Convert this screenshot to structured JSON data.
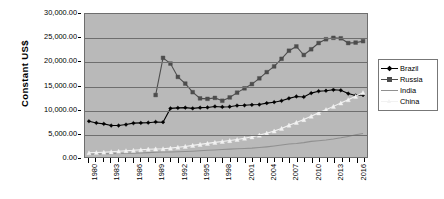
{
  "chart_data": {
    "type": "line",
    "title": "",
    "xlabel": "",
    "ylabel": "Constant US$",
    "ylim": [
      0,
      30000
    ],
    "ytick_labels": [
      "0.00",
      "5,000.00",
      "10,000.00",
      "15,000.00",
      "20,000.00",
      "25,000.00",
      "30,000.00"
    ],
    "ytick_values": [
      0,
      5000,
      10000,
      15000,
      20000,
      25000,
      30000
    ],
    "grid": true,
    "legend_position": "right",
    "x": [
      1980,
      1981,
      1982,
      1983,
      1984,
      1985,
      1986,
      1987,
      1988,
      1989,
      1990,
      1991,
      1992,
      1993,
      1994,
      1995,
      1996,
      1997,
      1998,
      1999,
      2000,
      2001,
      2002,
      2003,
      2004,
      2005,
      2006,
      2007,
      2008,
      2009,
      2010,
      2011,
      2012,
      2013,
      2014,
      2015,
      2016,
      2017
    ],
    "xtick_labels": [
      "1980",
      "1983",
      "1986",
      "1989",
      "1992",
      "1995",
      "1998",
      "2001",
      "2004",
      "2007",
      "2010",
      "2013",
      "2016"
    ],
    "xtick_values": [
      1980,
      1983,
      1986,
      1989,
      1992,
      1995,
      1998,
      2001,
      2004,
      2007,
      2010,
      2013,
      2016
    ],
    "xlim": [
      1980,
      2017
    ],
    "series": [
      {
        "name": "Brazil",
        "color": "#000000",
        "marker": "diamond",
        "x": [
          1980,
          1981,
          1982,
          1983,
          1984,
          1985,
          1986,
          1987,
          1988,
          1989,
          1990,
          1991,
          1992,
          1993,
          1994,
          1995,
          1996,
          1997,
          1998,
          1999,
          2000,
          2001,
          2002,
          2003,
          2004,
          2005,
          2006,
          2007,
          2008,
          2009,
          2010,
          2011,
          2012,
          2013,
          2014,
          2015,
          2016,
          2017
        ],
        "values": [
          7500,
          7150,
          6950,
          6600,
          6600,
          6800,
          7100,
          7150,
          7200,
          7350,
          7300,
          10200,
          10300,
          10350,
          10200,
          10350,
          10400,
          10600,
          10500,
          10550,
          10800,
          10850,
          10950,
          11000,
          11300,
          11500,
          11800,
          12300,
          12700,
          12600,
          13400,
          13800,
          13900,
          14100,
          14000,
          13300,
          12900,
          13000
        ]
      },
      {
        "name": "Russia",
        "color": "#4d4d4d",
        "marker": "square",
        "x": [
          1989,
          1990,
          1991,
          1992,
          1993,
          1994,
          1995,
          1996,
          1997,
          1998,
          1999,
          2000,
          2001,
          2002,
          2003,
          2004,
          2005,
          2006,
          2007,
          2008,
          2009,
          2010,
          2011,
          2012,
          2013,
          2014,
          2015,
          2016,
          2017
        ],
        "values": [
          13000,
          20800,
          19600,
          16800,
          15400,
          13600,
          12300,
          12200,
          12400,
          11800,
          12500,
          13500,
          14400,
          15300,
          16500,
          17800,
          19000,
          20600,
          22300,
          23200,
          21400,
          22600,
          23900,
          24700,
          25000,
          24900,
          23900,
          24000,
          24300
        ]
      },
      {
        "name": "India",
        "color": "#909090",
        "marker": "none",
        "x": [
          1980,
          1981,
          1982,
          1983,
          1984,
          1985,
          1986,
          1987,
          1988,
          1989,
          1990,
          1991,
          1992,
          1993,
          1994,
          1995,
          1996,
          1997,
          1998,
          1999,
          2000,
          2001,
          2002,
          2003,
          2004,
          2005,
          2006,
          2007,
          2008,
          2009,
          2010,
          2011,
          2012,
          2013,
          2014,
          2015,
          2016,
          2017
        ],
        "values": [
          600,
          620,
          650,
          700,
          730,
          770,
          810,
          840,
          920,
          980,
          1040,
          1050,
          1090,
          1140,
          1220,
          1310,
          1410,
          1480,
          1560,
          1660,
          1720,
          1790,
          1860,
          1980,
          2130,
          2300,
          2500,
          2720,
          2820,
          3020,
          3280,
          3420,
          3550,
          3760,
          4020,
          4320,
          4650,
          4950
        ]
      },
      {
        "name": "China",
        "color": "#f2f2f2",
        "marker": "triangle",
        "x": [
          1980,
          1981,
          1982,
          1983,
          1984,
          1985,
          1986,
          1987,
          1988,
          1989,
          1990,
          1991,
          1992,
          1993,
          1994,
          1995,
          1996,
          1997,
          1998,
          1999,
          2000,
          2001,
          2002,
          2003,
          2004,
          2005,
          2006,
          2007,
          2008,
          2009,
          2010,
          2011,
          2012,
          2013,
          2014,
          2015,
          2016,
          2017
        ],
        "values": [
          900,
          940,
          1010,
          1090,
          1200,
          1320,
          1400,
          1520,
          1640,
          1690,
          1730,
          1860,
          2040,
          2220,
          2440,
          2650,
          2860,
          3070,
          3260,
          3450,
          3680,
          3940,
          4230,
          4590,
          5000,
          5450,
          6000,
          6680,
          7250,
          7850,
          8560,
          9260,
          9930,
          10620,
          11330,
          12020,
          12730,
          13500
        ]
      }
    ]
  },
  "legend": {
    "items": [
      {
        "label": "Brazil"
      },
      {
        "label": "Russia"
      },
      {
        "label": "India"
      },
      {
        "label": "China"
      }
    ]
  }
}
